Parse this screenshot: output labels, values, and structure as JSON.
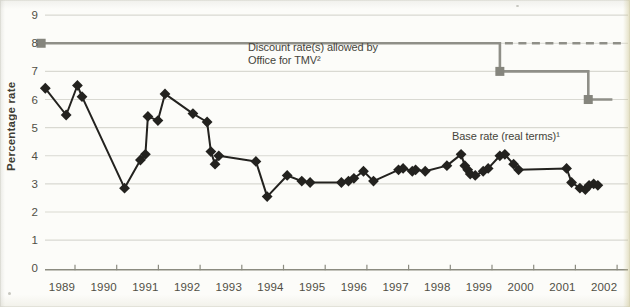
{
  "annotations": {
    "discount_label_line1": "Discount rate(s) allowed by",
    "discount_label_line2": "Office for TMV²",
    "base_rate_label": "Base rate (real terms)¹"
  },
  "chart_data": {
    "type": "line",
    "title": "",
    "xlabel": "",
    "ylabel": "Percentage rate",
    "ylim": [
      0,
      9
    ],
    "xlim": [
      1988.4,
      2002.6
    ],
    "grid": "horizontal",
    "legend_position": "inline-annotations",
    "yticks": [
      0,
      1,
      2,
      3,
      4,
      5,
      6,
      7,
      8,
      9
    ],
    "xticks": [
      1989,
      1990,
      1991,
      1992,
      1993,
      1994,
      1995,
      1996,
      1997,
      1998,
      1999,
      2000,
      2001,
      2002
    ],
    "colors": {
      "base_series": "#23221f",
      "discount_series": "#8f8f88",
      "discount_marker": "#85857d",
      "gridline": "#d9d9d2",
      "axis": "#8b8b80",
      "tick_text": "#504f45",
      "annotation_text": "#45443b"
    },
    "series": [
      {
        "name": "Base rate (real terms)¹",
        "marker": "diamond",
        "line_style": "solid",
        "color": "#23221f",
        "points": [
          [
            1988.6,
            6.4
          ],
          [
            1989.1,
            5.45
          ],
          [
            1989.37,
            6.5
          ],
          [
            1989.48,
            6.1
          ],
          [
            1990.5,
            2.85
          ],
          [
            1990.88,
            3.85
          ],
          [
            1991.0,
            4.05
          ],
          [
            1991.06,
            5.4
          ],
          [
            1991.3,
            5.25
          ],
          [
            1991.47,
            6.2
          ],
          [
            1992.14,
            5.5
          ],
          [
            1992.48,
            5.2
          ],
          [
            1992.57,
            4.15
          ],
          [
            1992.67,
            3.7
          ],
          [
            1992.76,
            4.0
          ],
          [
            1993.65,
            3.8
          ],
          [
            1993.92,
            2.55
          ],
          [
            1994.4,
            3.3
          ],
          [
            1994.75,
            3.1
          ],
          [
            1994.95,
            3.05
          ],
          [
            1995.7,
            3.05
          ],
          [
            1995.87,
            3.1
          ],
          [
            1996.0,
            3.2
          ],
          [
            1996.23,
            3.45
          ],
          [
            1996.47,
            3.1
          ],
          [
            1997.07,
            3.5
          ],
          [
            1997.18,
            3.55
          ],
          [
            1997.4,
            3.45
          ],
          [
            1997.48,
            3.5
          ],
          [
            1997.71,
            3.45
          ],
          [
            1998.23,
            3.65
          ],
          [
            1998.57,
            4.05
          ],
          [
            1998.66,
            3.65
          ],
          [
            1998.73,
            3.5
          ],
          [
            1998.79,
            3.35
          ],
          [
            1998.91,
            3.3
          ],
          [
            1999.1,
            3.45
          ],
          [
            1999.22,
            3.55
          ],
          [
            1999.5,
            4.0
          ],
          [
            1999.62,
            4.05
          ],
          [
            1999.83,
            3.7
          ],
          [
            1999.95,
            3.5
          ],
          [
            2001.1,
            3.55
          ],
          [
            2001.22,
            3.05
          ],
          [
            2001.42,
            2.85
          ],
          [
            2001.55,
            2.8
          ],
          [
            2001.64,
            2.95
          ],
          [
            2001.75,
            3.0
          ],
          [
            2001.85,
            2.95
          ]
        ]
      },
      {
        "name": "Discount rate(s) allowed by Office for TMV²",
        "marker": "square",
        "line_style": "solid",
        "color": "#8f8f88",
        "points": [
          [
            1988.5,
            8
          ],
          [
            1999.5,
            8
          ],
          [
            1999.5,
            7
          ],
          [
            2001.62,
            7
          ],
          [
            2001.62,
            6
          ],
          [
            2002.2,
            6
          ]
        ],
        "marker_points": [
          [
            1988.5,
            8
          ],
          [
            1999.5,
            7
          ],
          [
            2001.62,
            6
          ]
        ]
      },
      {
        "name": "Discount rate dashed continuation at 8",
        "marker": "none",
        "line_style": "dashed",
        "color": "#8f8f88",
        "points": [
          [
            1999.62,
            8
          ],
          [
            2002.42,
            8
          ]
        ]
      }
    ]
  }
}
